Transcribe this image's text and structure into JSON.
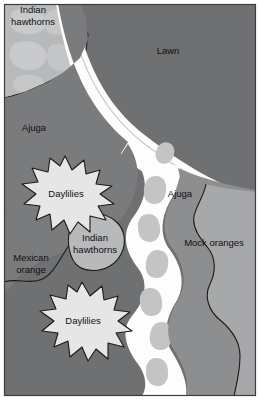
{
  "figure": {
    "kind": "garden-planting-plan",
    "width": 260,
    "height": 414,
    "border_color": "#3c3c3c",
    "background": "#ffffff"
  },
  "palette": {
    "lawn": "#6f7072",
    "bed_dark": "#7a7b7d",
    "bed_mid": "#8d8e90",
    "bed_light": "#a7a8aa",
    "shrub_light": "#b8b9bb",
    "mottle_light": "#c0c1c3",
    "path_white": "#fdfdfd",
    "stepping_stone": "#c3c4c6",
    "starburst_fill": "#e6e6e6",
    "outline": "#1a1a1a",
    "label_text": "#101010"
  },
  "labels": [
    {
      "id": "indian-hawthorns-top",
      "text_lines": [
        "Indian",
        "hawthorns"
      ],
      "x": 33,
      "y": 13
    },
    {
      "id": "lawn",
      "text_lines": [
        "Lawn"
      ],
      "x": 168,
      "y": 51
    },
    {
      "id": "ajuga-left",
      "text_lines": [
        "Ajuga"
      ],
      "x": 34,
      "y": 128
    },
    {
      "id": "daylilies-upper",
      "text_lines": [
        "Daylilies"
      ],
      "x": 65,
      "y": 194
    },
    {
      "id": "ajuga-right",
      "text_lines": [
        "Ajuga"
      ],
      "x": 179,
      "y": 194
    },
    {
      "id": "indian-hawthorns-mid",
      "text_lines": [
        "Indian",
        "hawthorns"
      ],
      "x": 90,
      "y": 244
    },
    {
      "id": "mock-oranges",
      "text_lines": [
        "Mock oranges"
      ],
      "x": 214,
      "y": 243
    },
    {
      "id": "mexican-orange",
      "text_lines": [
        "Mexican",
        "orange"
      ],
      "x": 30,
      "y": 262
    },
    {
      "id": "daylilies-lower",
      "text_lines": [
        "Daylilies"
      ],
      "x": 81,
      "y": 321
    }
  ],
  "regions": [
    {
      "id": "lawn-area",
      "name": "lawn",
      "tone": "#6f7072"
    },
    {
      "id": "indian-hawthorns-top-bed",
      "name": "Indian hawthorns (upper left)",
      "tone": "#b8b9bb"
    },
    {
      "id": "ajuga-left-bed",
      "name": "Ajuga (left)",
      "tone": "#7a7b7d"
    },
    {
      "id": "ajuga-right-bed",
      "name": "Ajuga (right)",
      "tone": "#8d8e90"
    },
    {
      "id": "mock-oranges-bed",
      "name": "Mock oranges",
      "tone": "#a7a8aa"
    },
    {
      "id": "mexican-orange-bed",
      "name": "Mexican orange",
      "tone": "#7a7b7d"
    },
    {
      "id": "indian-hawthorns-mid-bed",
      "name": "Indian hawthorns (middle)",
      "tone": "#b8b9bb"
    },
    {
      "id": "daylilies-upper-clump",
      "name": "Daylilies (upper)",
      "tone": "#e6e6e6"
    },
    {
      "id": "daylilies-lower-clump",
      "name": "Daylilies (lower)",
      "tone": "#e6e6e6"
    },
    {
      "id": "garden-path",
      "name": "white garden path",
      "tone": "#fdfdfd"
    },
    {
      "id": "stepping-stones",
      "name": "stepping stones",
      "tone": "#c3c4c6",
      "count": 8
    }
  ]
}
